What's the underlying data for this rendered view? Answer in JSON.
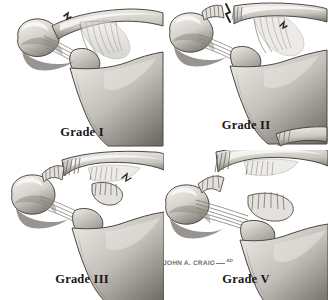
{
  "figure": {
    "background_color": "#ffffff",
    "style": "grayscale medical illustration",
    "layout": "2x2 grid"
  },
  "panels": [
    {
      "id": "grade-1",
      "label": "Grade I",
      "description": "Acromioclavicular ligament sprain, joint intact, no displacement"
    },
    {
      "id": "grade-2",
      "label": "Grade II",
      "description": "Acromioclavicular ligament torn, coracoclavicular ligament intact, partial displacement"
    },
    {
      "id": "grade-3",
      "label": "Grade III",
      "description": "Both acromioclavicular and coracoclavicular ligaments torn, clavicle displaced superiorly"
    },
    {
      "id": "grade-5",
      "label": "Grade V",
      "description": "Complete ligament disruption with severe superior clavicular displacement"
    }
  ],
  "signature": {
    "name": "JOHN A. CRAIG",
    "suffix": "AD"
  },
  "palette": {
    "bone_light": "#f2f0ee",
    "bone_mid": "#cfcbc6",
    "bone_shadow": "#9a968f",
    "bone_dark": "#6e6a64",
    "ligament": "#ddd9d3",
    "outline": "#4a4843",
    "deep_shadow": "#55524d",
    "label_color": "#17171a",
    "signature_color": "#6d6d72"
  }
}
